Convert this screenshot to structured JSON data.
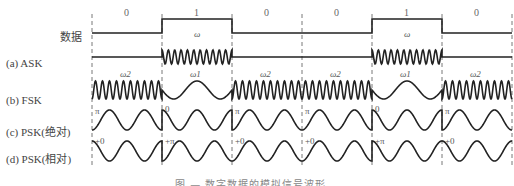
{
  "rows": {
    "data": {
      "label": "数据"
    },
    "ask": {
      "label": "(a) ASK"
    },
    "fsk": {
      "label": "(b) FSK"
    },
    "psk_abs": {
      "label": "(c) PSK(绝对)"
    },
    "psk_rel": {
      "label": "(d) PSK(相对)"
    }
  },
  "bits": [
    "0",
    "1",
    "0",
    "0",
    "1",
    "0"
  ],
  "ask_freq_labels": [
    "",
    "ω",
    "",
    "",
    "ω",
    ""
  ],
  "fsk_freq_labels": [
    "ω2",
    "ω1",
    "ω2",
    "ω2",
    "ω1",
    "ω2"
  ],
  "psk_abs_phases": [
    "π",
    "0",
    "π",
    "π",
    "0",
    "π"
  ],
  "psk_rel_phases": [
    "+0",
    "+π",
    "+0",
    "+0",
    "+π",
    "+0"
  ],
  "caption": "图 — 数字数据的模拟信号波形"
}
